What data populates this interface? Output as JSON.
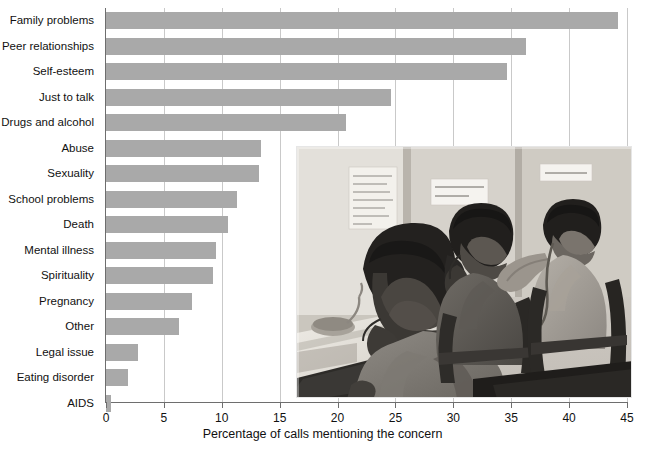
{
  "chart_data": {
    "type": "bar",
    "orientation": "horizontal",
    "title": "",
    "xlabel": "Percentage of calls mentioning the concern",
    "ylabel": "",
    "xlim": [
      0,
      45
    ],
    "xticks": [
      0,
      5,
      10,
      15,
      20,
      25,
      30,
      35,
      40,
      45
    ],
    "grid": true,
    "grid_axis": "x",
    "bar_color": "#a9a9a9",
    "categories": [
      "Family problems",
      "Peer relationships",
      "Self-esteem",
      "Just to talk",
      "Drugs and alcohol",
      "Abuse",
      "Sexuality",
      "School problems",
      "Death",
      "Mental illness",
      "Spirituality",
      "Pregnancy",
      "Other",
      "Legal issue",
      "Eating disorder",
      "AIDS"
    ],
    "values": [
      44.2,
      36.3,
      34.6,
      24.6,
      20.7,
      13.4,
      13.2,
      11.3,
      10.5,
      9.5,
      9.2,
      7.4,
      6.3,
      2.8,
      1.9,
      0.4
    ]
  },
  "photo": {
    "description": "Black and white photograph of three teenage volunteers answering telephones at a crisis help line, seated at desks in partitioned cubicles with handwritten posters on the walls",
    "poster_left_text": "Please don't give up, there are people who love you, and drugs always change how you feel",
    "poster_center_text": "LISTEN WHEN CALLED  SAVE A LIFE!",
    "poster_right_text": "SAVE MY LIFE"
  }
}
